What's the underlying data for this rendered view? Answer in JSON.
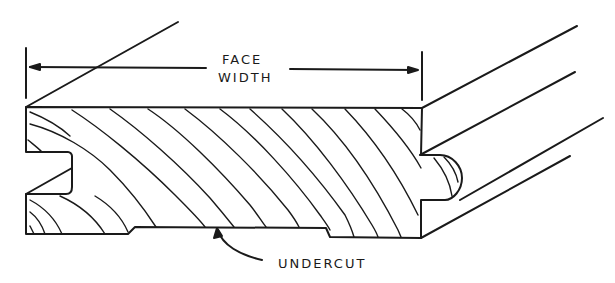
{
  "diagram": {
    "labels": {
      "face_line1": "FACE",
      "face_line2": "WIDTH",
      "undercut": "UNDERCUT"
    },
    "colors": {
      "ink": "#1a1a1a",
      "background": "#ffffff"
    }
  }
}
